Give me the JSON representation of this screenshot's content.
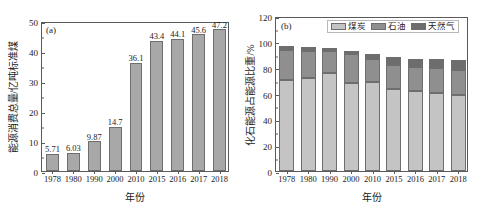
{
  "figure": {
    "background": "#ffffff",
    "width": 479,
    "height": 213
  },
  "chart_data": [
    {
      "type": "bar",
      "panel": "(a)",
      "title": "",
      "xlabel": "年份",
      "ylabel": "能源消费总量/亿吨标准煤",
      "categories": [
        "1978",
        "1980",
        "1990",
        "2000",
        "2010",
        "2015",
        "2016",
        "2017",
        "2018"
      ],
      "values": [
        5.71,
        6.03,
        9.87,
        14.7,
        36.1,
        43.4,
        44.1,
        45.6,
        47.2
      ],
      "value_labels": [
        "5.71",
        "6.03",
        "9.87",
        "14.7",
        "36.1",
        "43.4",
        "44.1",
        "45.6",
        "47.2"
      ],
      "ylim": [
        0,
        50
      ],
      "yticks": [
        0,
        10,
        20,
        30,
        40,
        50
      ],
      "ytick_labels": [
        "0",
        "10",
        "20",
        "30",
        "40",
        "50"
      ],
      "grid": false,
      "legend": null,
      "bar_color": "#a8a8a8",
      "bar_edge_color": "#6e6e6e"
    },
    {
      "type": "bar",
      "stacked": true,
      "panel": "(b)",
      "title": "",
      "xlabel": "年份",
      "ylabel": "化石能源占能源比重/%",
      "categories": [
        "1978",
        "1980",
        "1990",
        "2000",
        "2010",
        "2015",
        "2016",
        "2017",
        "2018"
      ],
      "series": [
        {
          "name": "煤炭",
          "color": "#c4c4c4",
          "values": [
            70.7,
            72.2,
            76.2,
            68.5,
            69.2,
            63.8,
            62.2,
            60.6,
            59.0
          ]
        },
        {
          "name": "石油",
          "color": "#8f8f8f",
          "values": [
            22.7,
            20.7,
            16.6,
            22.0,
            17.4,
            18.4,
            18.7,
            18.9,
            18.9
          ]
        },
        {
          "name": "天然气",
          "color": "#6d6d6d",
          "values": [
            3.2,
            3.1,
            2.1,
            2.2,
            4.0,
            5.9,
            6.1,
            7.0,
            7.8
          ]
        }
      ],
      "ylim": [
        0,
        120
      ],
      "yticks": [
        0,
        20,
        40,
        60,
        80,
        100,
        120
      ],
      "ytick_labels": [
        "0",
        "20",
        "40",
        "60",
        "80",
        "100",
        "120"
      ],
      "grid": false,
      "legend_position": "top-right",
      "legend_entries": [
        "煤炭",
        "石油",
        "天然气"
      ]
    }
  ]
}
